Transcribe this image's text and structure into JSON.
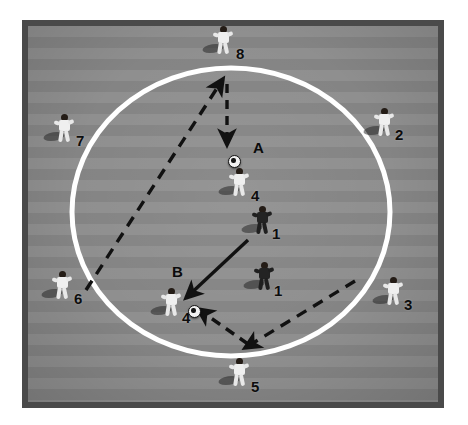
{
  "diagram": {
    "surface": "grass-pitch-striped",
    "colors": {
      "border": "#4a4a4a",
      "pitch_light": "#8f8f8f",
      "pitch_dark": "#848484",
      "circle_line": "#ffffff",
      "arrow": "#111111",
      "light_kit": "#efefef",
      "dark_kit": "#232323",
      "label": "#0d0d0d"
    }
  },
  "field": {
    "circle": {
      "cx": 231,
      "cy": 212,
      "rx": 159,
      "ry": 144,
      "stroke_width": 5
    }
  },
  "zones": [
    {
      "id": "A",
      "label": "A",
      "x": 253,
      "y": 140
    },
    {
      "id": "B",
      "label": "B",
      "x": 172,
      "y": 264
    }
  ],
  "balls": [
    {
      "id": "ball-a",
      "zone": "A",
      "x": 228,
      "y": 155
    },
    {
      "id": "ball-b",
      "zone": "B",
      "x": 188,
      "y": 305
    }
  ],
  "players": [
    {
      "id": "p8",
      "label": "8",
      "kit": "light",
      "x": 212,
      "y": 26,
      "label_dx": 24,
      "label_dy": 20,
      "role": "outside"
    },
    {
      "id": "p2",
      "label": "2",
      "kit": "light",
      "x": 373,
      "y": 108,
      "label_dx": 22,
      "label_dy": 19,
      "role": "outside"
    },
    {
      "id": "p3",
      "label": "3",
      "kit": "light",
      "x": 382,
      "y": 277,
      "label_dx": 22,
      "label_dy": 20,
      "role": "outside"
    },
    {
      "id": "p5",
      "label": "5",
      "kit": "light",
      "x": 228,
      "y": 358,
      "label_dx": 23,
      "label_dy": 21,
      "role": "outside"
    },
    {
      "id": "p6",
      "label": "6",
      "kit": "light",
      "x": 51,
      "y": 271,
      "label_dx": 23,
      "label_dy": 20,
      "role": "outside"
    },
    {
      "id": "p7",
      "label": "7",
      "kit": "light",
      "x": 53,
      "y": 114,
      "label_dx": 23,
      "label_dy": 19,
      "role": "outside"
    },
    {
      "id": "p4a",
      "label": "4",
      "kit": "light",
      "x": 228,
      "y": 168,
      "label_dx": 23,
      "label_dy": 20,
      "role": "inside-attacker"
    },
    {
      "id": "p1a",
      "label": "1",
      "kit": "dark",
      "x": 251,
      "y": 206,
      "label_dx": 21,
      "label_dy": 20,
      "role": "inside-defender"
    },
    {
      "id": "p1b",
      "label": "1",
      "kit": "dark",
      "x": 253,
      "y": 262,
      "label_dx": 21,
      "label_dy": 21,
      "role": "inside-defender"
    },
    {
      "id": "p4b",
      "label": "4",
      "kit": "light",
      "x": 160,
      "y": 288,
      "label_dx": 22,
      "label_dy": 22,
      "role": "inside-attacker"
    }
  ],
  "arrows": [
    {
      "id": "pass-6-to-8",
      "style": "dashed",
      "from": [
        86,
        290
      ],
      "to": [
        223,
        79
      ],
      "meaning": "pass-long-diagonal"
    },
    {
      "id": "pass-8-to-ballA",
      "style": "dashed",
      "from": [
        227,
        84
      ],
      "to": [
        227,
        145
      ],
      "meaning": "pass-to-zone-A"
    },
    {
      "id": "run-A-to-B",
      "style": "solid",
      "from": [
        248,
        240
      ],
      "to": [
        186,
        298
      ],
      "meaning": "player-run"
    },
    {
      "id": "pass-3-to-5",
      "style": "dashed",
      "from": [
        355,
        281
      ],
      "to": [
        245,
        348
      ],
      "meaning": "pass-to-bottom"
    },
    {
      "id": "pass-5-to-ballB",
      "style": "dashed",
      "from": [
        248,
        344
      ],
      "to": [
        198,
        309
      ],
      "meaning": "pass-to-zone-B"
    }
  ],
  "legend": {
    "solid_arrow": "player movement",
    "dashed_arrow": "ball pass"
  }
}
